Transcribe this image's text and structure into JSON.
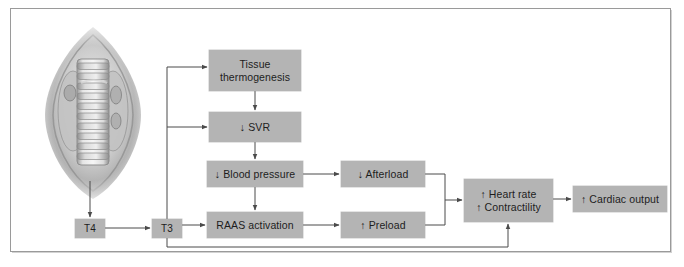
{
  "figure": {
    "frame_color": "#9a9a9a",
    "node_fill": "#b4b4b4",
    "node_text_color": "#1d1d1d",
    "connector_color": "#4a4a4a",
    "background": "#ffffff"
  },
  "illustration": {
    "name": "thyroid-gland-trachea-illustration",
    "description": "Anatomical drawing of thyroid gland and trachea"
  },
  "nodes": {
    "tissue_thermogenesis": "Tissue\nthermogenesis",
    "svr": "↓ SVR",
    "blood_pressure": "↓ Blood pressure",
    "raas_activation": "RAAS activation",
    "afterload": "↓ Afterload",
    "preload": "↑ Preload",
    "heart_rate_contractility": "↑ Heart rate\n↑ Contractility",
    "cardiac_output": "↑ Cardiac output",
    "t4": "T4",
    "t3": "T3"
  },
  "edges": [
    {
      "name": "thyroid-to-t4",
      "from": "thyroid gland",
      "to": "T4"
    },
    {
      "name": "t4-to-t3",
      "from": "T4",
      "to": "T3"
    },
    {
      "name": "t3-to-tissue-thermogenesis",
      "from": "T3",
      "to": "Tissue thermogenesis"
    },
    {
      "name": "t3-to-svr",
      "from": "T3",
      "to": "↓ SVR"
    },
    {
      "name": "t3-to-raas",
      "from": "T3",
      "to": "RAAS activation"
    },
    {
      "name": "t3-to-heart-rate",
      "from": "T3",
      "to": "↑ Heart rate ↑ Contractility"
    },
    {
      "name": "tissue-thermogenesis-to-svr",
      "from": "Tissue thermogenesis",
      "to": "↓ SVR"
    },
    {
      "name": "svr-to-blood-pressure",
      "from": "↓ SVR",
      "to": "↓ Blood pressure"
    },
    {
      "name": "blood-pressure-to-afterload",
      "from": "↓ Blood pressure",
      "to": "↓ Afterload"
    },
    {
      "name": "blood-pressure-to-raas",
      "from": "↓ Blood pressure",
      "to": "RAAS activation"
    },
    {
      "name": "raas-to-preload",
      "from": "RAAS activation",
      "to": "↑ Preload"
    },
    {
      "name": "afterload-preload-to-heart-rate",
      "from": "↓ Afterload and ↑ Preload",
      "to": "↑ Heart rate ↑ Contractility"
    },
    {
      "name": "heart-rate-to-cardiac-output",
      "from": "↑ Heart rate ↑ Contractility",
      "to": "↑ Cardiac output"
    }
  ]
}
